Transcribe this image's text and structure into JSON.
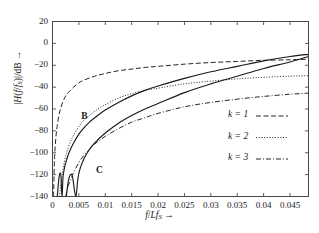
{
  "chart_data": {
    "type": "line",
    "title": "",
    "xlabel": "f/Lf_S →",
    "ylabel": "|H(f/f_S)|/dB →",
    "xlim": [
      0,
      0.0485
    ],
    "ylim": [
      -140,
      20
    ],
    "xticks": [
      0,
      0.005,
      0.01,
      0.015,
      0.02,
      0.025,
      0.03,
      0.035,
      0.04,
      0.045
    ],
    "xticklabels": [
      "0",
      "0.005",
      "0.01",
      "0.015",
      "0.02",
      "0.025",
      "0.03",
      "0.035",
      "0.04",
      "0.045"
    ],
    "yticks": [
      20,
      0,
      -20,
      -40,
      -60,
      -80,
      -100,
      -120,
      -140
    ],
    "yticklabels": [
      "20",
      "0",
      "−20",
      "−40",
      "−60",
      "−80",
      "−100",
      "−120",
      "−140"
    ],
    "grid": false,
    "legend_position": "center-right",
    "series": [
      {
        "name": "k = 1",
        "style": "dashed",
        "color": "#1a1a1a",
        "points": [
          [
            0.0002,
            -140
          ],
          [
            0.00035,
            -110
          ],
          [
            0.0005,
            -95
          ],
          [
            0.0007,
            -83
          ],
          [
            0.0009,
            -75
          ],
          [
            0.0012,
            -66
          ],
          [
            0.0015,
            -60
          ],
          [
            0.002,
            -53
          ],
          [
            0.0025,
            -48
          ],
          [
            0.003,
            -45
          ],
          [
            0.004,
            -40
          ],
          [
            0.005,
            -36
          ],
          [
            0.006,
            -33.5
          ],
          [
            0.008,
            -30
          ],
          [
            0.01,
            -27.5
          ],
          [
            0.0125,
            -25
          ],
          [
            0.015,
            -23.5
          ],
          [
            0.0175,
            -22
          ],
          [
            0.02,
            -21
          ],
          [
            0.025,
            -19
          ],
          [
            0.03,
            -17.5
          ],
          [
            0.035,
            -16.5
          ],
          [
            0.04,
            -15.5
          ],
          [
            0.045,
            -15
          ],
          [
            0.0485,
            -14.5
          ]
        ]
      },
      {
        "name": "k = 2",
        "style": "dotted",
        "color": "#1a1a1a",
        "points": [
          [
            0.0013,
            -140
          ],
          [
            0.0017,
            -125
          ],
          [
            0.002,
            -115
          ],
          [
            0.0025,
            -103
          ],
          [
            0.003,
            -95
          ],
          [
            0.0035,
            -89
          ],
          [
            0.004,
            -84
          ],
          [
            0.005,
            -76
          ],
          [
            0.006,
            -70
          ],
          [
            0.007,
            -66
          ],
          [
            0.008,
            -62
          ],
          [
            0.01,
            -56
          ],
          [
            0.0125,
            -50
          ],
          [
            0.015,
            -46
          ],
          [
            0.0175,
            -43
          ],
          [
            0.02,
            -41
          ],
          [
            0.025,
            -37
          ],
          [
            0.03,
            -34.5
          ],
          [
            0.035,
            -32.5
          ],
          [
            0.04,
            -31
          ],
          [
            0.045,
            -30
          ],
          [
            0.0485,
            -29.5
          ]
        ]
      },
      {
        "name": "k = 3",
        "style": "dashdot",
        "color": "#1a1a1a",
        "points": [
          [
            0.0025,
            -140
          ],
          [
            0.003,
            -130
          ],
          [
            0.0035,
            -124
          ],
          [
            0.004,
            -118
          ],
          [
            0.005,
            -109
          ],
          [
            0.006,
            -102
          ],
          [
            0.007,
            -97
          ],
          [
            0.008,
            -92
          ],
          [
            0.01,
            -85
          ],
          [
            0.0125,
            -78
          ],
          [
            0.015,
            -72
          ],
          [
            0.0175,
            -68
          ],
          [
            0.02,
            -64
          ],
          [
            0.025,
            -58
          ],
          [
            0.03,
            -54
          ],
          [
            0.035,
            -51
          ],
          [
            0.04,
            -48.5
          ],
          [
            0.045,
            -46.5
          ],
          [
            0.0485,
            -45.5
          ]
        ]
      },
      {
        "name": "B",
        "style": "solid",
        "color": "#1a1a1a",
        "points": [
          [
            0.0009,
            -140
          ],
          [
            0.0012,
            -124
          ],
          [
            0.0014,
            -119
          ],
          [
            0.0016,
            -121
          ],
          [
            0.0018,
            -140
          ],
          [
            0.002,
            -122
          ],
          [
            0.0023,
            -113
          ],
          [
            0.0027,
            -106
          ],
          [
            0.0032,
            -99
          ],
          [
            0.004,
            -91
          ],
          [
            0.005,
            -83
          ],
          [
            0.006,
            -77
          ],
          [
            0.007,
            -72
          ],
          [
            0.008,
            -68
          ],
          [
            0.01,
            -61
          ],
          [
            0.0125,
            -54
          ],
          [
            0.015,
            -48
          ],
          [
            0.0175,
            -43
          ],
          [
            0.02,
            -39
          ],
          [
            0.025,
            -32
          ],
          [
            0.03,
            -26
          ],
          [
            0.035,
            -21
          ],
          [
            0.04,
            -16
          ],
          [
            0.045,
            -12
          ],
          [
            0.0485,
            -10
          ]
        ]
      },
      {
        "name": "C",
        "style": "solid",
        "color": "#1a1a1a",
        "points": [
          [
            0.0026,
            -140
          ],
          [
            0.003,
            -126
          ],
          [
            0.0034,
            -120
          ],
          [
            0.0038,
            -122
          ],
          [
            0.0044,
            -140
          ],
          [
            0.0048,
            -124
          ],
          [
            0.0052,
            -115
          ],
          [
            0.006,
            -105
          ],
          [
            0.007,
            -97
          ],
          [
            0.008,
            -91
          ],
          [
            0.01,
            -82
          ],
          [
            0.0125,
            -73
          ],
          [
            0.015,
            -66
          ],
          [
            0.0175,
            -60
          ],
          [
            0.02,
            -55
          ],
          [
            0.025,
            -45
          ],
          [
            0.03,
            -37
          ],
          [
            0.035,
            -30
          ],
          [
            0.04,
            -23
          ],
          [
            0.045,
            -17
          ],
          [
            0.0485,
            -12
          ]
        ]
      }
    ],
    "annotations": [
      {
        "text": "B",
        "x": 0.006,
        "y": -68
      },
      {
        "text": "C",
        "x": 0.0088,
        "y": -118
      }
    ],
    "legend": [
      {
        "label": "k = 1",
        "style": "dashed"
      },
      {
        "label": "k = 2",
        "style": "dotted"
      },
      {
        "label": "k = 3",
        "style": "dashdot"
      }
    ]
  },
  "axis": {
    "y_label_parts": {
      "pre": "|H(",
      "italic1": "f",
      "slash": "/",
      "italic2": "f",
      "sub": "S",
      "post": ")|/dB",
      "arrow": "→"
    },
    "x_label_parts": {
      "italic1": "f",
      "slash": "/",
      "italic2": "L",
      "italic3": "f",
      "sub": "S",
      "arrow": "→"
    }
  }
}
